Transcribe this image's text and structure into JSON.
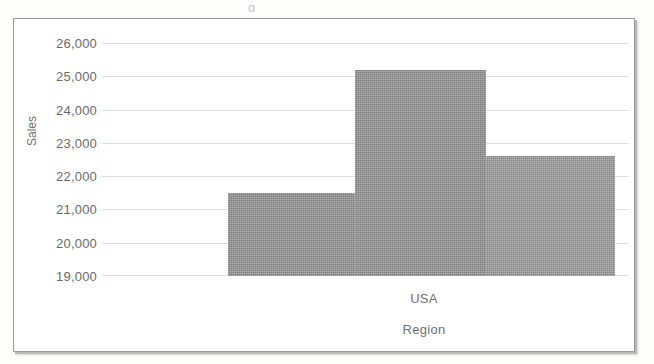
{
  "chart_data": {
    "type": "bar",
    "title": "",
    "subtitle": "",
    "xlabel": "Region",
    "ylabel": "Sales",
    "categories": [
      "",
      "USA",
      ""
    ],
    "visible_category_labels": [
      "USA"
    ],
    "values": [
      21500,
      25200,
      22600
    ],
    "series": [
      {
        "name": "Sales",
        "values": [
          21500,
          25200,
          22600
        ]
      }
    ],
    "ylim": [
      19000,
      26000
    ],
    "yticks": [
      26000,
      25000,
      24000,
      23000,
      22000,
      21000,
      20000,
      19000
    ],
    "ytick_labels": [
      "26,000",
      "25,000",
      "24,000",
      "23,000",
      "22,000",
      "21,000",
      "20,000",
      "19,000"
    ],
    "grid": true,
    "grid_axis": "y",
    "legend": false,
    "legend_position": "none",
    "bar_gap": 0,
    "bar_colors": [
      "#8b8b8b",
      "#8b8b8b",
      "#949494"
    ],
    "gridline_color": "#dedede",
    "tick_label_color": "#6b6b6b",
    "axis_title_color": "#6f6f6f",
    "plot_background": "#ffffff",
    "frame_border_color": "#9a9a9a"
  },
  "chart": {
    "y_axis_title": "Sales",
    "x_axis_title": "Region",
    "category_label": "USA",
    "y_ticks": [
      {
        "label": "26,000",
        "value": 26000
      },
      {
        "label": "25,000",
        "value": 25000
      },
      {
        "label": "24,000",
        "value": 24000
      },
      {
        "label": "23,000",
        "value": 23000
      },
      {
        "label": "22,000",
        "value": 22000
      },
      {
        "label": "21,000",
        "value": 21000
      },
      {
        "label": "20,000",
        "value": 20000
      },
      {
        "label": "19,000",
        "value": 19000
      }
    ],
    "bars": [
      {
        "name": "bar-1",
        "value": 21500
      },
      {
        "name": "bar-2",
        "value": 25200
      },
      {
        "name": "bar-3",
        "value": 22600
      }
    ]
  },
  "page": {
    "scan_artifact": "g"
  }
}
